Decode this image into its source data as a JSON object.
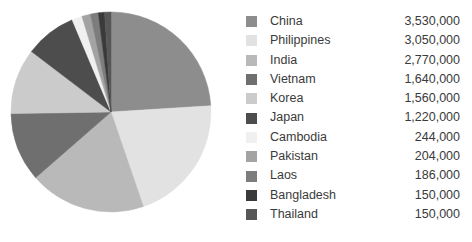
{
  "chart_data": {
    "type": "pie",
    "title": "",
    "legend_position": "right",
    "start_angle_deg": 0,
    "direction": "clockwise",
    "total": 16470000,
    "categories": [
      "China",
      "Philippines",
      "India",
      "Vietnam",
      "Korea",
      "Japan",
      "Cambodia",
      "Pakistan",
      "Laos",
      "Bangladesh",
      "Thailand"
    ],
    "values": [
      3530000,
      3050000,
      2770000,
      1640000,
      1560000,
      1220000,
      244000,
      204000,
      186000,
      150000,
      150000
    ],
    "value_labels": [
      "3,530,000",
      "3,050,000",
      "2,770,000",
      "1,640,000",
      "1,560,000",
      "1,220,000",
      "244,000",
      "204,000",
      "186,000",
      "150,000",
      "150,000"
    ],
    "percentages": [
      21.4,
      18.5,
      16.8,
      10.0,
      9.5,
      7.4,
      1.5,
      1.2,
      1.1,
      0.9,
      0.9
    ],
    "colors": [
      "#8d8d8d",
      "#e2e2e2",
      "#b9b9b9",
      "#6f6f6f",
      "#cbcbcb",
      "#4d4d4d",
      "#f0f0f0",
      "#a3a3a3",
      "#7d7d7d",
      "#3a3a3a",
      "#575757"
    ],
    "slices": [
      {
        "label": "China",
        "value": 3530000,
        "value_label": "3,530,000",
        "percent": 21.4,
        "color": "#8d8d8d"
      },
      {
        "label": "Philippines",
        "value": 3050000,
        "value_label": "3,050,000",
        "percent": 18.5,
        "color": "#e2e2e2"
      },
      {
        "label": "India",
        "value": 2770000,
        "value_label": "2,770,000",
        "percent": 16.8,
        "color": "#b9b9b9"
      },
      {
        "label": "Vietnam",
        "value": 1640000,
        "value_label": "1,640,000",
        "percent": 10.0,
        "color": "#6f6f6f"
      },
      {
        "label": "Korea",
        "value": 1560000,
        "value_label": "1,560,000",
        "percent": 9.5,
        "color": "#cbcbcb"
      },
      {
        "label": "Japan",
        "value": 1220000,
        "value_label": "1,220,000",
        "percent": 7.4,
        "color": "#4d4d4d"
      },
      {
        "label": "Cambodia",
        "value": 244000,
        "value_label": "244,000",
        "percent": 1.5,
        "color": "#f0f0f0"
      },
      {
        "label": "Pakistan",
        "value": 204000,
        "value_label": "204,000",
        "percent": 1.2,
        "color": "#a3a3a3"
      },
      {
        "label": "Laos",
        "value": 186000,
        "value_label": "186,000",
        "percent": 1.1,
        "color": "#7d7d7d"
      },
      {
        "label": "Bangladesh",
        "value": 150000,
        "value_label": "150,000",
        "percent": 0.9,
        "color": "#3a3a3a"
      },
      {
        "label": "Thailand",
        "value": 150000,
        "value_label": "150,000",
        "percent": 0.9,
        "color": "#575757"
      }
    ]
  },
  "geometry": {
    "center_x": 101,
    "center_y": 101,
    "radius": 100
  }
}
